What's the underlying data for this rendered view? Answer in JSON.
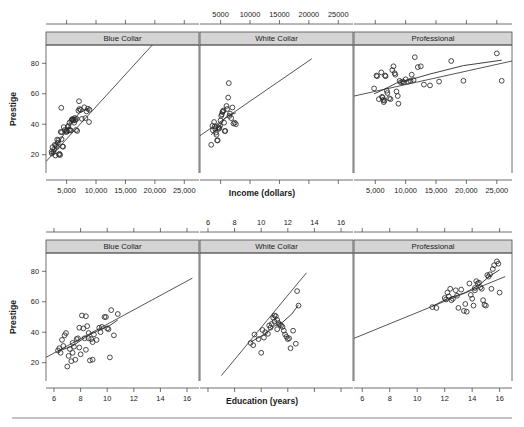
{
  "figure": {
    "title": "",
    "panel_labels": [
      "Blue Collar",
      "White Collar",
      "Professional"
    ],
    "y_axis_title": "Prestige",
    "y_ticks": [
      20,
      40,
      60,
      80
    ],
    "y_range": [
      8,
      92
    ]
  },
  "chart_data": [
    {
      "type": "scatter",
      "id": "row1-blue-collar",
      "title": "Blue Collar",
      "xlabel": "Income (dollars)",
      "ylabel": "Prestige",
      "xlim": [
        1500,
        27500
      ],
      "ylim": [
        8,
        92
      ],
      "x_ticks_bottom": [
        5000,
        10000,
        15000,
        20000,
        25000
      ],
      "x_tick_labels_bottom": [
        "5,000",
        "10,000",
        "15,000",
        "20,000",
        "25,000"
      ],
      "grid": false,
      "legend": "none",
      "points": [
        [
          2450,
          22.0
        ],
        [
          2500,
          20.8
        ],
        [
          2600,
          24.9
        ],
        [
          2800,
          21.8
        ],
        [
          2900,
          23.5
        ],
        [
          3000,
          26.5
        ],
        [
          3100,
          19.5
        ],
        [
          3200,
          26.1
        ],
        [
          3350,
          25.1
        ],
        [
          3400,
          29.9
        ],
        [
          3500,
          27.8
        ],
        [
          3600,
          29.4
        ],
        [
          3700,
          20.1
        ],
        [
          3800,
          20.6
        ],
        [
          3900,
          19.8
        ],
        [
          4000,
          35.0
        ],
        [
          4100,
          50.8
        ],
        [
          4150,
          30.2
        ],
        [
          4200,
          34.8
        ],
        [
          4300,
          25.5
        ],
        [
          4400,
          25.2
        ],
        [
          4500,
          38.1
        ],
        [
          4700,
          36.2
        ],
        [
          4900,
          34.9
        ],
        [
          5000,
          35.9
        ],
        [
          5100,
          35.2
        ],
        [
          5200,
          38.2
        ],
        [
          5300,
          39.0
        ],
        [
          5400,
          36.0
        ],
        [
          5500,
          41.0
        ],
        [
          5600,
          36.2
        ],
        [
          5700,
          35.9
        ],
        [
          5800,
          42.2
        ],
        [
          5900,
          43.2
        ],
        [
          6000,
          42.9
        ],
        [
          6100,
          43.5
        ],
        [
          6200,
          42.5
        ],
        [
          6300,
          41.0
        ],
        [
          6400,
          44.1
        ],
        [
          6500,
          42.8
        ],
        [
          6600,
          36.2
        ],
        [
          6700,
          43.5
        ],
        [
          6800,
          35.6
        ],
        [
          7000,
          48.9
        ],
        [
          7100,
          55.1
        ],
        [
          7200,
          50.0
        ],
        [
          7400,
          49.5
        ],
        [
          7600,
          43.5
        ],
        [
          8000,
          51.1
        ],
        [
          8200,
          44.0
        ],
        [
          8400,
          48.4
        ],
        [
          8600,
          50.2
        ],
        [
          8800,
          41.5
        ],
        [
          8900,
          49.5
        ]
      ],
      "fit_line": {
        "x0": 1500,
        "y0": 15.5,
        "x1": 19800,
        "y1": 93.0
      },
      "lowess": [
        [
          2450,
          20.0
        ],
        [
          3500,
          27.0
        ],
        [
          4800,
          35.0
        ],
        [
          6000,
          42.0
        ],
        [
          7200,
          47.5
        ],
        [
          8900,
          50.5
        ]
      ]
    },
    {
      "type": "scatter",
      "id": "row1-white-collar",
      "title": "White Collar",
      "xlabel": "Income (dollars)",
      "ylabel": "Prestige",
      "xlim": [
        1500,
        27500
      ],
      "ylim": [
        8,
        92
      ],
      "x_ticks_top": [
        5000,
        10000,
        15000,
        20000,
        25000
      ],
      "x_tick_labels_top": [
        "5000",
        "10000",
        "15000",
        "20000",
        "25000"
      ],
      "grid": false,
      "legend": "none",
      "points": [
        [
          3400,
          26.5
        ],
        [
          3600,
          38.9
        ],
        [
          3700,
          36.0
        ],
        [
          3900,
          41.5
        ],
        [
          4000,
          38.5
        ],
        [
          4100,
          36.8
        ],
        [
          4200,
          34.5
        ],
        [
          4300,
          33.1
        ],
        [
          4400,
          29.4
        ],
        [
          4500,
          29.4
        ],
        [
          4600,
          38.0
        ],
        [
          4700,
          37.0
        ],
        [
          4800,
          37.5
        ],
        [
          4900,
          39.0
        ],
        [
          5000,
          42.5
        ],
        [
          5100,
          45.5
        ],
        [
          5200,
          46.5
        ],
        [
          5300,
          48.0
        ],
        [
          5400,
          48.5
        ],
        [
          5500,
          49.0
        ],
        [
          5600,
          41.0
        ],
        [
          5700,
          35.5
        ],
        [
          5800,
          35.6
        ],
        [
          6000,
          52.0
        ],
        [
          6100,
          50.0
        ],
        [
          6300,
          57.5
        ],
        [
          6400,
          67.0
        ],
        [
          6500,
          45.5
        ],
        [
          6600,
          47.0
        ],
        [
          6800,
          44.0
        ],
        [
          7000,
          51.0
        ],
        [
          7200,
          40.5
        ],
        [
          7400,
          41.0
        ],
        [
          7600,
          40.0
        ]
      ],
      "fit_line": {
        "x0": 1500,
        "y0": 32.5,
        "x1": 20500,
        "y1": 83.0
      },
      "lowess": [
        [
          3400,
          33.0
        ],
        [
          4300,
          36.5
        ],
        [
          5000,
          39.5
        ],
        [
          5600,
          43.5
        ],
        [
          6400,
          46.0
        ],
        [
          7600,
          47.5
        ]
      ]
    },
    {
      "type": "scatter",
      "id": "row1-professional",
      "title": "Professional",
      "xlabel": "Income (dollars)",
      "ylabel": "Prestige",
      "xlim": [
        1500,
        27500
      ],
      "ylim": [
        8,
        92
      ],
      "x_ticks_bottom": [
        5000,
        10000,
        15000,
        20000,
        25000
      ],
      "x_tick_labels_bottom": [
        "5,000",
        "10,000",
        "15,000",
        "20,000",
        "25,000"
      ],
      "grid": false,
      "legend": "none",
      "points": [
        [
          4800,
          63.5
        ],
        [
          5200,
          72.0
        ],
        [
          5300,
          71.5
        ],
        [
          5600,
          56.5
        ],
        [
          6000,
          74.0
        ],
        [
          6100,
          58.0
        ],
        [
          6200,
          57.5
        ],
        [
          6300,
          56.0
        ],
        [
          6400,
          54.5
        ],
        [
          6500,
          55.5
        ],
        [
          6600,
          72.0
        ],
        [
          6700,
          71.5
        ],
        [
          6900,
          62.0
        ],
        [
          7000,
          60.5
        ],
        [
          7300,
          57.0
        ],
        [
          7500,
          56.5
        ],
        [
          7800,
          75.5
        ],
        [
          8000,
          78.0
        ],
        [
          8200,
          73.5
        ],
        [
          8300,
          72.5
        ],
        [
          8500,
          61.5
        ],
        [
          8700,
          58.5
        ],
        [
          8800,
          53.5
        ],
        [
          9000,
          68.5
        ],
        [
          9200,
          67.5
        ],
        [
          9500,
          68.0
        ],
        [
          9700,
          67.5
        ],
        [
          10000,
          69.5
        ],
        [
          10400,
          68.0
        ],
        [
          10800,
          68.5
        ],
        [
          11000,
          72.5
        ],
        [
          11300,
          69.0
        ],
        [
          11500,
          84.0
        ],
        [
          12000,
          77.5
        ],
        [
          12500,
          78.0
        ],
        [
          13000,
          66.0
        ],
        [
          14000,
          65.5
        ],
        [
          15500,
          68.0
        ],
        [
          17500,
          81.5
        ],
        [
          19500,
          68.5
        ],
        [
          25000,
          86.5
        ],
        [
          25800,
          68.5
        ]
      ],
      "fit_line": {
        "x0": 1500,
        "y0": 58.5,
        "x1": 27500,
        "y1": 81.5
      },
      "lowess": [
        [
          4800,
          60.0
        ],
        [
          6500,
          63.0
        ],
        [
          8500,
          67.0
        ],
        [
          11000,
          69.5
        ],
        [
          14000,
          73.0
        ],
        [
          19500,
          78.5
        ],
        [
          25800,
          82.0
        ]
      ]
    },
    {
      "type": "scatter",
      "id": "row2-blue-collar",
      "title": "Blue Collar",
      "xlabel": "Education (years)",
      "ylabel": "Prestige",
      "xlim": [
        5.4,
        16.9
      ],
      "ylim": [
        8,
        92
      ],
      "x_ticks_bottom": [
        6,
        8,
        10,
        12,
        14,
        16
      ],
      "x_tick_labels_bottom": [
        "6",
        "8",
        "10",
        "12",
        "14",
        "16"
      ],
      "grid": false,
      "legend": "none",
      "points": [
        [
          6.3,
          28.0
        ],
        [
          6.4,
          29.5
        ],
        [
          6.5,
          26.5
        ],
        [
          6.6,
          35.0
        ],
        [
          6.7,
          31.0
        ],
        [
          6.8,
          38.0
        ],
        [
          6.9,
          39.5
        ],
        [
          7.0,
          17.5
        ],
        [
          7.1,
          24.5
        ],
        [
          7.2,
          29.0
        ],
        [
          7.3,
          21.0
        ],
        [
          7.4,
          26.5
        ],
        [
          7.5,
          30.5
        ],
        [
          7.6,
          22.0
        ],
        [
          7.7,
          35.5
        ],
        [
          7.8,
          36.0
        ],
        [
          7.9,
          43.0
        ],
        [
          8.0,
          25.5
        ],
        [
          8.1,
          51.0
        ],
        [
          8.2,
          42.5
        ],
        [
          8.3,
          36.0
        ],
        [
          8.4,
          50.5
        ],
        [
          8.5,
          44.0
        ],
        [
          8.6,
          36.0
        ],
        [
          8.7,
          21.5
        ],
        [
          8.8,
          35.5
        ],
        [
          8.9,
          22.0
        ],
        [
          9.0,
          38.5
        ],
        [
          9.2,
          35.0
        ],
        [
          9.4,
          43.0
        ],
        [
          9.5,
          40.0
        ],
        [
          9.6,
          43.5
        ],
        [
          9.8,
          50.0
        ],
        [
          9.9,
          50.0
        ],
        [
          10.0,
          42.5
        ],
        [
          10.1,
          42.0
        ],
        [
          10.2,
          23.5
        ],
        [
          10.3,
          54.5
        ],
        [
          10.5,
          38.0
        ],
        [
          10.8,
          52.0
        ],
        [
          7.4,
          33.0
        ],
        [
          7.9,
          30.0
        ],
        [
          8.4,
          28.5
        ],
        [
          8.6,
          39.5
        ],
        [
          8.9,
          33.5
        ]
      ],
      "fit_line": {
        "x0": 5.4,
        "y0": 23.5,
        "x1": 16.4,
        "y1": 75.5
      },
      "lowess": [
        [
          6.3,
          27.5
        ],
        [
          7.4,
          31.0
        ],
        [
          8.5,
          37.5
        ],
        [
          9.4,
          41.5
        ],
        [
          10.2,
          44.5
        ],
        [
          10.8,
          48.0
        ]
      ]
    },
    {
      "type": "scatter",
      "id": "row2-white-collar",
      "title": "White Collar",
      "xlabel": "Education (years)",
      "ylabel": "Prestige",
      "xlim": [
        5.4,
        16.9
      ],
      "ylim": [
        8,
        92
      ],
      "x_ticks_top": [
        6,
        8,
        10,
        12,
        14,
        16
      ],
      "x_tick_labels_top": [
        "6",
        "8",
        "10",
        "12",
        "14",
        "16"
      ],
      "grid": false,
      "legend": "none",
      "points": [
        [
          9.2,
          33.0
        ],
        [
          9.4,
          31.5
        ],
        [
          9.5,
          38.5
        ],
        [
          9.8,
          35.5
        ],
        [
          10.0,
          26.5
        ],
        [
          10.1,
          41.5
        ],
        [
          10.2,
          36.5
        ],
        [
          10.3,
          40.0
        ],
        [
          10.5,
          39.0
        ],
        [
          10.6,
          44.5
        ],
        [
          10.8,
          45.5
        ],
        [
          10.9,
          49.5
        ],
        [
          11.0,
          51.0
        ],
        [
          11.1,
          50.5
        ],
        [
          11.2,
          48.0
        ],
        [
          11.3,
          46.0
        ],
        [
          11.4,
          45.0
        ],
        [
          11.5,
          44.5
        ],
        [
          11.6,
          43.5
        ],
        [
          11.7,
          41.0
        ],
        [
          11.8,
          38.5
        ],
        [
          11.9,
          37.0
        ],
        [
          12.0,
          35.5
        ],
        [
          12.1,
          36.0
        ],
        [
          12.2,
          29.5
        ],
        [
          12.4,
          41.0
        ],
        [
          12.6,
          32.5
        ],
        [
          12.7,
          67.0
        ],
        [
          12.8,
          57.5
        ],
        [
          11.0,
          47.0
        ],
        [
          11.2,
          42.0
        ],
        [
          10.7,
          43.0
        ]
      ],
      "fit_line": {
        "x0": 7.0,
        "y0": 11.5,
        "x1": 13.4,
        "y1": 79.0
      },
      "lowess": [
        [
          9.2,
          33.5
        ],
        [
          10.2,
          38.5
        ],
        [
          11.0,
          44.0
        ],
        [
          11.6,
          46.5
        ],
        [
          12.3,
          52.0
        ],
        [
          12.8,
          58.0
        ]
      ]
    },
    {
      "type": "scatter",
      "id": "row2-professional",
      "title": "Professional",
      "xlabel": "Education (years)",
      "ylabel": "Prestige",
      "xlim": [
        5.4,
        16.9
      ],
      "ylim": [
        8,
        92
      ],
      "x_ticks_bottom": [
        6,
        8,
        10,
        12,
        14,
        16
      ],
      "x_tick_labels_bottom": [
        "6",
        "8",
        "10",
        "12",
        "14",
        "16"
      ],
      "grid": false,
      "legend": "none",
      "points": [
        [
          11.1,
          56.5
        ],
        [
          11.4,
          56.0
        ],
        [
          12.0,
          62.5
        ],
        [
          12.1,
          61.5
        ],
        [
          12.2,
          66.0
        ],
        [
          12.3,
          63.5
        ],
        [
          12.4,
          68.5
        ],
        [
          12.5,
          61.0
        ],
        [
          12.6,
          62.0
        ],
        [
          12.8,
          67.5
        ],
        [
          13.0,
          56.0
        ],
        [
          13.2,
          68.0
        ],
        [
          13.4,
          54.0
        ],
        [
          13.5,
          58.5
        ],
        [
          13.6,
          53.5
        ],
        [
          13.8,
          72.0
        ],
        [
          14.0,
          62.0
        ],
        [
          14.1,
          57.5
        ],
        [
          14.2,
          67.5
        ],
        [
          14.3,
          73.5
        ],
        [
          14.4,
          72.0
        ],
        [
          14.5,
          72.5
        ],
        [
          14.6,
          69.5
        ],
        [
          14.7,
          68.5
        ],
        [
          14.8,
          61.0
        ],
        [
          14.9,
          58.0
        ],
        [
          15.0,
          57.5
        ],
        [
          15.1,
          77.5
        ],
        [
          15.2,
          76.5
        ],
        [
          15.3,
          78.0
        ],
        [
          15.4,
          68.5
        ],
        [
          15.5,
          81.5
        ],
        [
          15.6,
          84.0
        ],
        [
          15.8,
          86.5
        ],
        [
          15.9,
          85.0
        ],
        [
          16.0,
          66.0
        ],
        [
          13.9,
          64.5
        ],
        [
          12.9,
          64.0
        ],
        [
          14.2,
          69.0
        ]
      ],
      "fit_line": {
        "x0": 5.4,
        "y0": 36.0,
        "x1": 16.4,
        "y1": 76.5
      },
      "lowess": [
        [
          11.1,
          57.0
        ],
        [
          12.3,
          62.5
        ],
        [
          13.5,
          66.0
        ],
        [
          14.5,
          71.0
        ],
        [
          15.3,
          77.0
        ],
        [
          16.0,
          81.0
        ]
      ]
    }
  ]
}
